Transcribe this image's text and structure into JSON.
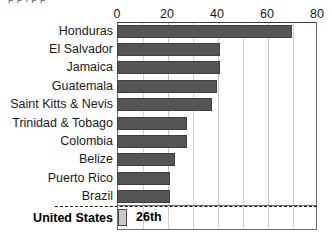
{
  "clipped_title_remnant": "p p , p p",
  "chart_data": {
    "type": "bar",
    "orientation": "horizontal",
    "title": "",
    "xlabel": "",
    "ylabel": "",
    "xlim": [
      0,
      80
    ],
    "xticks": [
      0,
      20,
      40,
      60,
      80
    ],
    "xtick_labels": [
      "0",
      "20",
      "40",
      "60",
      "80"
    ],
    "minor_gridlines": [
      10,
      20,
      30,
      40,
      50,
      60,
      70
    ],
    "grid": true,
    "legend": "none",
    "categories": [
      "Honduras",
      "El Salvador",
      "Jamaica",
      "Guatemala",
      "Saint Kitts & Nevis",
      "Trinidad & Tobago",
      "Colombia",
      "Belize",
      "Puerto Rico",
      "Brazil"
    ],
    "values": [
      70,
      41,
      41,
      40,
      38,
      28,
      28,
      23,
      21,
      21
    ],
    "bar_color": "#555555",
    "highlight": {
      "label": "United States",
      "value": 2,
      "annotation": "26th",
      "bar_color": "#c9c9c9",
      "separator": "dashed"
    }
  }
}
